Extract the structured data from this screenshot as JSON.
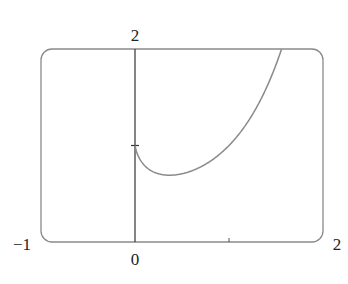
{
  "chart_data": {
    "type": "line",
    "title": "",
    "xlabel": "",
    "ylabel": "",
    "function": "y = x^x",
    "xlim": [
      -1,
      2
    ],
    "ylim": [
      0,
      2
    ],
    "grid": false,
    "tick_labels": {
      "x_left": "−1",
      "x_origin": "0",
      "x_right": "2",
      "y_top": "2"
    },
    "ticks": {
      "x": [
        1
      ],
      "y": [
        1
      ]
    },
    "series": [
      {
        "name": "x^x",
        "x": [
          0,
          0.05,
          0.1,
          0.2,
          0.3,
          0.3679,
          0.5,
          0.7,
          0.9,
          1.0,
          1.2,
          1.4,
          1.5,
          1.559
        ],
        "y": [
          1.0,
          0.861,
          0.794,
          0.725,
          0.697,
          0.692,
          0.707,
          0.779,
          0.91,
          1.0,
          1.245,
          1.601,
          1.837,
          2.0
        ]
      }
    ],
    "colors": {
      "curve": "#8a8a8a",
      "axis": "#333333",
      "frame": "#8a8a8a"
    }
  }
}
